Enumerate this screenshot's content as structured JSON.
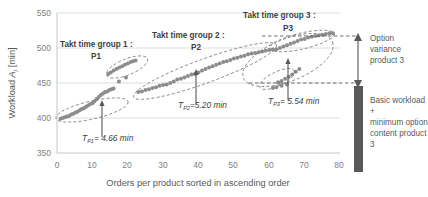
{
  "chart_data": {
    "type": "scatter",
    "title": "",
    "xlabel": "Orders per product sorted in ascending order",
    "ylabel": "Workload Aⱼ [min]",
    "ylabel_main": "Workload",
    "ylabel_symbol": "A",
    "ylabel_subscript": "j",
    "ylabel_unit": "[min]",
    "xlim": [
      0,
      80
    ],
    "ylim": [
      350,
      550
    ],
    "xticks": [
      0,
      10,
      20,
      30,
      40,
      50,
      60,
      70,
      80
    ],
    "yticks": [
      350,
      400,
      450,
      500,
      550
    ],
    "grid": "horizontal",
    "legend": "none",
    "marker_color": "#8c8c8c",
    "series": [
      {
        "name": "Product 1 lower band (P1)",
        "x": [
          1.0,
          1.6,
          2.2,
          2.8,
          3.4,
          4.0,
          4.6,
          5.2,
          5.8,
          6.4,
          7.0,
          7.6,
          8.2,
          8.8,
          9.4,
          10.0,
          10.6,
          11.2,
          11.8,
          12.4,
          13.0,
          13.6,
          14.2,
          14.8,
          15.4,
          16.0
        ],
        "y": [
          399,
          400,
          401,
          402,
          403,
          405,
          406,
          408,
          409,
          411,
          413,
          414,
          416,
          418,
          420,
          421,
          424,
          427,
          430,
          433,
          435,
          437,
          438,
          440,
          441,
          442
        ]
      },
      {
        "name": "Product 1 upper cluster (P1)",
        "x": [
          14.5,
          15.2,
          16.0,
          16.8,
          17.6,
          18.4,
          19.2,
          20.0,
          20.8,
          21.5,
          22.2
        ],
        "y": [
          463,
          465,
          468,
          470,
          472,
          474,
          476,
          478,
          480,
          481,
          482
        ]
      },
      {
        "name": "Product 1 isolated points",
        "x": [
          17.5,
          19.5
        ],
        "y": [
          452,
          458
        ]
      },
      {
        "name": "Product 2 band (P2)",
        "x": [
          23.0,
          24.0,
          25.0,
          26.0,
          27.0,
          28.0,
          29.0,
          30.0,
          31.0,
          32.0,
          33.0,
          34.0,
          35.0,
          36.0,
          37.0,
          38.0,
          39.0,
          40.0,
          41.0,
          42.0,
          43.0,
          44.0,
          45.0,
          46.0,
          47.0,
          48.0,
          49.0,
          50.0,
          51.0,
          52.0,
          53.0,
          54.0,
          55.0,
          56.0,
          57.0,
          58.0,
          59.0,
          60.0,
          61.0
        ],
        "y": [
          437,
          438,
          440,
          441,
          443,
          444,
          446,
          447,
          448,
          450,
          452,
          455,
          456,
          458,
          460,
          462,
          463,
          465,
          468,
          470,
          472,
          474,
          476,
          478,
          480,
          481,
          483,
          485,
          486,
          488,
          489,
          491,
          492,
          493,
          494,
          495,
          496,
          497,
          498
        ]
      },
      {
        "name": "Product 3 upper band (P3)",
        "x": [
          62.0,
          63.0,
          64.0,
          65.0,
          66.0,
          67.0,
          68.0,
          69.0,
          70.0,
          71.0,
          72.0,
          73.0,
          74.0,
          75.0,
          76.0,
          77.0,
          78.0
        ],
        "y": [
          498,
          500,
          502,
          504,
          506,
          508,
          510,
          512,
          513,
          515,
          516,
          517,
          518,
          519,
          520,
          521,
          521
        ]
      },
      {
        "name": "Product 3 lower cluster (P3)",
        "x": [
          62.5,
          63.5,
          64.5,
          65.5,
          66.5,
          67.5,
          68.5
        ],
        "y": [
          451,
          453,
          456,
          459,
          462,
          466,
          470
        ]
      },
      {
        "name": "Product 3 low tail",
        "x": [
          61.0,
          62.0,
          63.5,
          65.0
        ],
        "y": [
          443,
          444,
          446,
          448
        ]
      }
    ],
    "annotations": [
      {
        "name": "group-1",
        "title": "Takt time group 1 :",
        "sub": "P1"
      },
      {
        "name": "group-2",
        "title": "Takt time group 2 :",
        "sub": "P2"
      },
      {
        "name": "group-3",
        "title": "Takt time group 3 :",
        "sub": "P3"
      },
      {
        "name": "takt-p1",
        "symbol": "T",
        "subscript": "P1",
        "value": "= 4.66 min",
        "full": "T_P1 = 4.66 min"
      },
      {
        "name": "takt-p2",
        "symbol": "T",
        "subscript": "P2",
        "value": "=5.20 min",
        "full": "T_P2 = 5.20 min"
      },
      {
        "name": "takt-p3",
        "symbol": "T",
        "subscript": "P3",
        "value": "= 5.54 min",
        "full": "T_P3 = 5.54 min"
      }
    ],
    "side_bars": [
      {
        "name": "option-variance",
        "label_lines": [
          "Option",
          "variance",
          "product 3"
        ],
        "range_min": 450,
        "range_max": 522
      },
      {
        "name": "basic-workload",
        "label_lines": [
          "Basic workload +",
          "minimum option",
          "content product 3"
        ],
        "range_min": 350,
        "range_max": 450
      }
    ]
  }
}
